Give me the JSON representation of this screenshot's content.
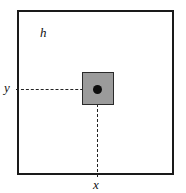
{
  "figure": {
    "type": "technical-diagram",
    "outer_region": {
      "label": "h",
      "fill": "#ffffff",
      "stroke": "#1a1a1a"
    },
    "inner_element": {
      "fill": "#9b9b9b",
      "stroke": "#2a2a2a",
      "center_marker": "filled-circle",
      "center_marker_color": "#0d0d0d"
    },
    "axes": {
      "y_label": "y",
      "x_label": "x",
      "leader_line_style": "dashed",
      "leader_line_color": "#222222"
    }
  }
}
